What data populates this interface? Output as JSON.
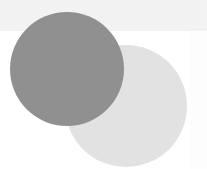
{
  "figure": {
    "title": "",
    "caption": "",
    "width": 207,
    "height": 169,
    "background_color": "#ffffff",
    "texture": "halftone-dither",
    "top_band": {
      "name": "top-band",
      "color": "#f0f0f0",
      "x": 0,
      "y": 0,
      "width": 207,
      "height": 31
    },
    "right_margin": {
      "name": "right-margin",
      "color": "#fdfdfd",
      "x": 190,
      "y": 31,
      "width": 17,
      "height": 138
    },
    "shapes": [
      {
        "name": "light-circle",
        "type": "circle",
        "color": "#e2e2e2",
        "center_x": 126,
        "center_y": 106,
        "radius": 61,
        "z_order": 1,
        "label": ""
      },
      {
        "name": "dark-circle",
        "type": "circle",
        "color": "#909090",
        "center_x": 67,
        "center_y": 69,
        "radius": 57,
        "z_order": 2,
        "label": ""
      }
    ]
  }
}
